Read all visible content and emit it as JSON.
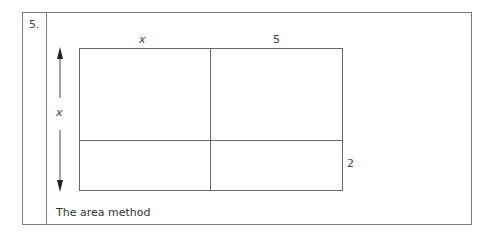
{
  "question_number": "5.",
  "diagram": {
    "top_labels": [
      "x",
      "5"
    ],
    "left_label": "x",
    "right_label": "2",
    "caption": "The area method"
  }
}
